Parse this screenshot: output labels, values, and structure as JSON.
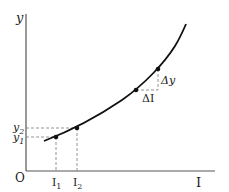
{
  "diagram": {
    "axes": {
      "y_label": "y",
      "x_label": "I",
      "origin_label": "O"
    },
    "points_lower": {
      "I1": "I",
      "I1_sub": "1",
      "I2": "I",
      "I2_sub": "2",
      "y1": "y",
      "y1_sub": "1",
      "y2": "y",
      "y2_sub": "2"
    },
    "increment": {
      "delta_y": "Δy",
      "delta_I": "ΔI"
    },
    "colors": {
      "curve": "#111111",
      "axis": "#555555",
      "dashed": "#888888"
    }
  }
}
